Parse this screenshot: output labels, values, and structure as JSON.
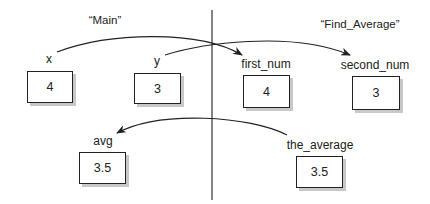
{
  "scopes": {
    "left": {
      "label": "“Main”"
    },
    "right": {
      "label": "“Find_Average”"
    }
  },
  "variables": [
    {
      "name": "x",
      "value": "4",
      "scope": "Main"
    },
    {
      "name": "y",
      "value": "3",
      "scope": "Main"
    },
    {
      "name": "first_num",
      "value": "4",
      "scope": "Find_Average"
    },
    {
      "name": "second_num",
      "value": "3",
      "scope": "Find_Average"
    },
    {
      "name": "avg",
      "value": "3.5",
      "scope": "Main"
    },
    {
      "name": "the_average",
      "value": "3.5",
      "scope": "Find_Average"
    }
  ],
  "arrows": [
    {
      "from": "x",
      "to": "first_num"
    },
    {
      "from": "y",
      "to": "second_num"
    },
    {
      "from": "the_average",
      "to": "avg"
    }
  ],
  "colors": {
    "stroke": "#222222",
    "shadow": "#c8c8c8",
    "background": "#ffffff"
  }
}
